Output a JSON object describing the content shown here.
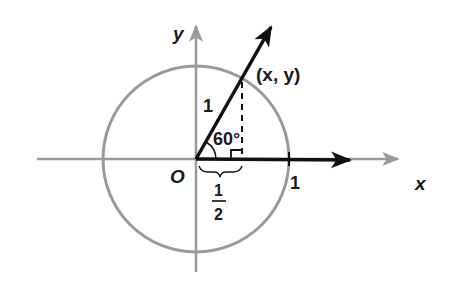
{
  "diagram": {
    "colors": {
      "axis": "#9a9a9a",
      "circle": "#9a9a9a",
      "vector": "#111111",
      "text": "#1a1a1a"
    },
    "labels": {
      "y_axis": "y",
      "x_axis": "x",
      "origin": "O",
      "point": "(x, y)",
      "radius": "1",
      "angle": "60°",
      "x_intercept": "1",
      "half_numerator": "1",
      "half_denominator": "2"
    },
    "geometry": {
      "origin": [
        196,
        159
      ],
      "radius": 93,
      "angle_deg": 60
    }
  }
}
